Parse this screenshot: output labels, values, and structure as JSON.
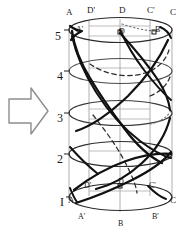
{
  "figure": {
    "arrow": {
      "name": "right-arrow",
      "direction": "right",
      "color": "#777777"
    },
    "stroke_color": "#1b1b1b",
    "light_stroke_color": "#8a8a8a",
    "background": "#ffffff",
    "axis_labels": [
      {
        "text": "5",
        "x": 55,
        "y": 30
      },
      {
        "text": "4",
        "x": 57,
        "y": 70
      },
      {
        "text": "3",
        "x": 57,
        "y": 112
      },
      {
        "text": "2",
        "x": 57,
        "y": 153
      },
      {
        "text": "I",
        "x": 60,
        "y": 196
      }
    ],
    "point_labels": [
      {
        "text": "A",
        "x": 66,
        "y": 8,
        "size": "pt"
      },
      {
        "text": "D'",
        "x": 87,
        "y": 6,
        "size": "pt"
      },
      {
        "text": "D",
        "x": 119,
        "y": 6,
        "size": "pt"
      },
      {
        "text": "C'",
        "x": 147,
        "y": 6,
        "size": "pt"
      },
      {
        "text": "C",
        "x": 170,
        "y": 8,
        "size": "pt"
      },
      {
        "text": "A'",
        "x": 76,
        "y": 26,
        "size": "pt-sm"
      },
      {
        "text": "D",
        "x": 119,
        "y": 28,
        "size": "pt-sm"
      },
      {
        "text": "B'",
        "x": 155,
        "y": 26,
        "size": "pt-sm"
      },
      {
        "text": "D'",
        "x": 84,
        "y": 182,
        "size": "pt-sm"
      },
      {
        "text": "D",
        "x": 118,
        "y": 178,
        "size": "pt-sm"
      },
      {
        "text": "C'",
        "x": 149,
        "y": 182,
        "size": "pt-sm"
      },
      {
        "text": "A",
        "x": 68,
        "y": 196,
        "size": "pt"
      },
      {
        "text": "C",
        "x": 170,
        "y": 196,
        "size": "pt"
      },
      {
        "text": "A'",
        "x": 78,
        "y": 213,
        "size": "pt-sm"
      },
      {
        "text": "B",
        "x": 118,
        "y": 220,
        "size": "pt-sm"
      },
      {
        "text": "B'",
        "x": 152,
        "y": 213,
        "size": "pt-sm"
      }
    ],
    "levels": [
      {
        "value": 5,
        "cy": 32
      },
      {
        "value": 4,
        "cy": 72
      },
      {
        "value": 3,
        "cy": 114
      },
      {
        "value": 2,
        "cy": 155
      },
      {
        "value": 1,
        "cy": 198
      }
    ],
    "cylinder": {
      "left": 69,
      "right": 172,
      "rx": 51.5,
      "ry": 13,
      "cx": 120.5
    },
    "generators_x": [
      69,
      89,
      120,
      150,
      172
    ]
  }
}
